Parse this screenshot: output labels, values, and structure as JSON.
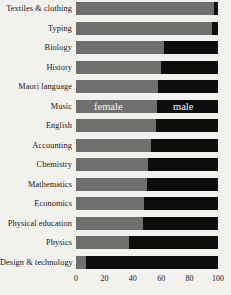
{
  "chart_data": {
    "type": "bar",
    "orientation": "horizontal",
    "stacked": true,
    "normalized_percent": true,
    "title": "",
    "subtitle": "",
    "xlabel": "",
    "ylabel": "",
    "xlim": [
      0,
      100
    ],
    "xticks": [
      0,
      20,
      40,
      60,
      80,
      100
    ],
    "xticklabels": [
      "0",
      "20",
      "40",
      "60",
      "80",
      "100"
    ],
    "grid": false,
    "legend_position": "in-bar",
    "categories": [
      "Textiles & clothing",
      "Typing",
      "Biology",
      "History",
      "Maori language",
      "Music",
      "English",
      "Accounting",
      "Chemistry",
      "Mathematics",
      "Economics",
      "Physical education",
      "Physics",
      "Design & technology"
    ],
    "series": [
      {
        "name": "female",
        "color": "#6f6f6f",
        "values": [
          97,
          96,
          62,
          60,
          58,
          57,
          56,
          53,
          51,
          50,
          48,
          47,
          37,
          7
        ]
      },
      {
        "name": "male",
        "color": "#0d0d0d",
        "values": [
          3,
          4,
          38,
          40,
          42,
          43,
          44,
          47,
          49,
          50,
          52,
          53,
          63,
          93
        ]
      }
    ],
    "annotations": [
      {
        "text": "female",
        "row": "Music",
        "segment": "female",
        "color": "#f4f3f0"
      },
      {
        "text": "male",
        "row": "Music",
        "segment": "male",
        "color": "#f4f3f0"
      }
    ]
  },
  "colors": {
    "background": "#f2f1ee",
    "female": "#6f6f6f",
    "male": "#0d0d0d",
    "text": "#16161a",
    "inbar_text": "#f4f3f0"
  }
}
